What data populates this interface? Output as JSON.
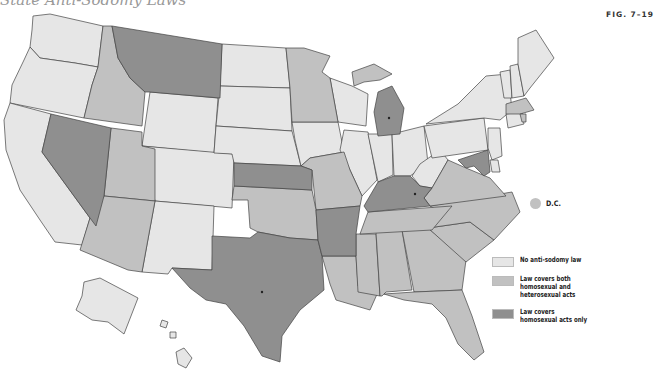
{
  "title": "State Anti-Sodomy Laws",
  "figure_label": "FIG. 7–19",
  "colors": {
    "none": "#e6e6e6",
    "both": "#c1c1c1",
    "homosexual_only": "#8f8f8f",
    "water": "#ffffff",
    "border": "#444444"
  },
  "legend": {
    "items": [
      {
        "key": "none",
        "label": "No anti-sodomy law"
      },
      {
        "key": "both",
        "label": "Law covers both\nhomosexual and\nheterosexual acts"
      },
      {
        "key": "homosexual_only",
        "label": "Law covers\nhomosexual acts only"
      }
    ]
  },
  "dc_marker": {
    "label": "D.C.",
    "category": "both"
  },
  "states": {
    "none": [
      "WA",
      "OR",
      "CA",
      "WY",
      "CO",
      "NM",
      "ND",
      "SD",
      "NE",
      "IA",
      "WI",
      "IL",
      "IN",
      "OH",
      "WV",
      "PA",
      "NY",
      "VT",
      "NH",
      "ME",
      "CT",
      "NJ",
      "DE",
      "AK",
      "HI"
    ],
    "both": [
      "ID",
      "UT",
      "AZ",
      "MN",
      "MO",
      "OK",
      "LA",
      "MS",
      "AL",
      "GA",
      "FL",
      "SC",
      "NC",
      "VA",
      "TN",
      "MA",
      "RI",
      "MI-UP"
    ],
    "homosexual_only": [
      "MT",
      "NV",
      "KS",
      "TX",
      "AR",
      "KY",
      "MI",
      "MD"
    ]
  }
}
